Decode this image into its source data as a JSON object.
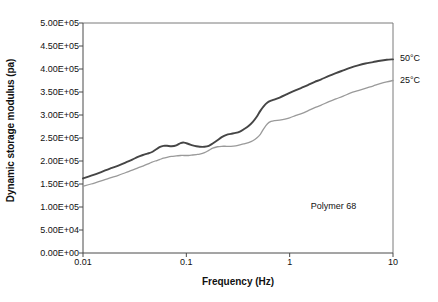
{
  "chart_data": {
    "type": "line",
    "title": "",
    "xlabel": "Frequency (Hz)",
    "ylabel": "Dynamic storage modulus (pa)",
    "xscale": "log",
    "yscale": "linear",
    "xlim": [
      0.01,
      10
    ],
    "ylim": [
      0,
      500000
    ],
    "grid": false,
    "legend_position": "right-outside",
    "xtick_labels": [
      "0.01",
      "0.1",
      "1",
      "10"
    ],
    "xtick_values": [
      0.01,
      0.1,
      1,
      10
    ],
    "ytick_labels": [
      "0.00E+00",
      "5.00E+04",
      "1.00E+05",
      "1.50E+05",
      "2.00E+05",
      "2.50E+05",
      "3.00E+05",
      "3.50E+05",
      "4.00E+05",
      "4.50E+05",
      "5.00E+05"
    ],
    "ytick_values": [
      0,
      50000,
      100000,
      150000,
      200000,
      250000,
      300000,
      350000,
      400000,
      450000,
      500000
    ],
    "annotations": [
      {
        "text": "Polymer 68",
        "x": 1.6,
        "y": 100000
      }
    ],
    "series": [
      {
        "name": "50°C",
        "color": "#454545",
        "width": 1.9,
        "label_at_end": true,
        "x": [
          0.01,
          0.012,
          0.015,
          0.018,
          0.022,
          0.026,
          0.03,
          0.034,
          0.038,
          0.042,
          0.046,
          0.05,
          0.055,
          0.06,
          0.065,
          0.072,
          0.08,
          0.088,
          0.095,
          0.105,
          0.115,
          0.125,
          0.135,
          0.15,
          0.165,
          0.18,
          0.2,
          0.22,
          0.245,
          0.27,
          0.3,
          0.33,
          0.36,
          0.4,
          0.44,
          0.48,
          0.52,
          0.56,
          0.61,
          0.66,
          0.72,
          0.8,
          0.9,
          1.0,
          1.15,
          1.3,
          1.5,
          1.75,
          2.0,
          2.4,
          2.8,
          3.3,
          3.9,
          4.6,
          5.4,
          6.4,
          7.5,
          8.7,
          10.0
        ],
        "y": [
          162000,
          168000,
          176000,
          183000,
          190000,
          197000,
          203000,
          209000,
          213000,
          216000,
          219000,
          224000,
          230000,
          233000,
          233000,
          232000,
          234000,
          239000,
          240000,
          237000,
          234000,
          232000,
          231000,
          231000,
          233000,
          238000,
          245000,
          252000,
          257000,
          259000,
          261000,
          264000,
          269000,
          276000,
          285000,
          296000,
          309000,
          319000,
          327000,
          331000,
          334000,
          338000,
          343000,
          348000,
          354000,
          359000,
          365000,
          372000,
          377000,
          385000,
          391000,
          397000,
          403000,
          408000,
          412000,
          415000,
          418000,
          420000,
          421000
        ]
      },
      {
        "name": "25°C",
        "color": "#9a9a9a",
        "width": 1.3,
        "label_at_end": true,
        "x": [
          0.01,
          0.012,
          0.015,
          0.018,
          0.022,
          0.026,
          0.03,
          0.034,
          0.038,
          0.042,
          0.046,
          0.05,
          0.055,
          0.06,
          0.065,
          0.072,
          0.08,
          0.088,
          0.095,
          0.105,
          0.115,
          0.125,
          0.135,
          0.15,
          0.165,
          0.18,
          0.2,
          0.22,
          0.245,
          0.27,
          0.3,
          0.33,
          0.36,
          0.4,
          0.44,
          0.48,
          0.52,
          0.56,
          0.61,
          0.66,
          0.72,
          0.8,
          0.9,
          1.0,
          1.15,
          1.3,
          1.5,
          1.75,
          2.0,
          2.4,
          2.8,
          3.3,
          3.9,
          4.6,
          5.4,
          6.4,
          7.5,
          8.7,
          10.0
        ],
        "y": [
          145000,
          150000,
          157000,
          163000,
          169000,
          175000,
          180000,
          185000,
          189000,
          193000,
          197000,
          200000,
          203000,
          206000,
          208000,
          210000,
          211000,
          212000,
          212000,
          212000,
          213000,
          214000,
          215000,
          218000,
          223000,
          228000,
          231000,
          232000,
          232000,
          232000,
          233000,
          235000,
          237000,
          240000,
          244000,
          250000,
          258000,
          270000,
          281000,
          286000,
          288000,
          289000,
          291000,
          294000,
          299000,
          303000,
          309000,
          316000,
          321000,
          329000,
          335000,
          341000,
          348000,
          353000,
          358000,
          363000,
          368000,
          372000,
          375000
        ]
      }
    ]
  }
}
